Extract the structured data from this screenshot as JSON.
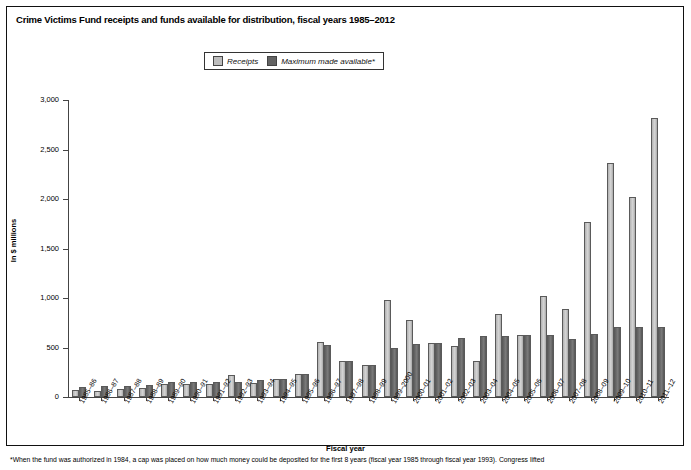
{
  "figure": {
    "title": "Crime Victims Fund receipts and funds available for distribution, fiscal years 1985–2012",
    "ylabel": "In $ millions",
    "xlabel": "Fiscal year",
    "footnote": "*When the fund was authorized in 1984, a cap was placed on how much money could be deposited for the first 8 years (fiscal year 1985 through fiscal year 1993). Congress lifted"
  },
  "legend": {
    "items": [
      {
        "label": "Receipts",
        "color": "#bdbdbd",
        "icon": "square-swatch-icon"
      },
      {
        "label": "Maximum made available*",
        "color": "#636363",
        "icon": "square-swatch-icon"
      }
    ]
  },
  "chart_data": {
    "type": "bar",
    "title": "Crime Victims Fund receipts and funds available for distribution, fiscal years 1985–2012",
    "xlabel": "Fiscal year",
    "ylabel": "In $ millions",
    "ylim": [
      0,
      3000
    ],
    "yticks": [
      0,
      500,
      1000,
      1500,
      2000,
      2500,
      3000
    ],
    "ytick_labels": [
      "0",
      "500",
      "1,000",
      "1,500",
      "2,000",
      "2,500",
      "3,000"
    ],
    "grid": false,
    "legend_position": "top-center",
    "categories": [
      "1985–86",
      "1986–87",
      "1987–88",
      "1988–89",
      "1989–90",
      "1990–91",
      "1991–92",
      "1992–93",
      "1993–94",
      "1994–95",
      "1995–96",
      "1996–97",
      "1997–98",
      "1998–99",
      "1999–2000",
      "2000–01",
      "2001–02",
      "2002–03",
      "2003–04",
      "2004–05",
      "2005–06",
      "2006–07",
      "2007–08",
      "2008–09",
      "2009–10",
      "2010–11",
      "2011–12"
    ],
    "series": [
      {
        "name": "Receipts",
        "color": "#bdbdbd",
        "values": [
          68,
          62,
          77,
          93,
          129,
          128,
          128,
          226,
          144,
          185,
          233,
          553,
          363,
          324,
          985,
          777,
          544,
          519,
          368,
          834,
          625,
          1019,
          894,
          1765,
          2368,
          2021,
          2816
        ]
      },
      {
        "name": "Maximum made available*",
        "color": "#636363",
        "values": [
          100,
          110,
          110,
          125,
          150,
          150,
          150,
          150,
          170,
          185,
          233,
          528,
          363,
          324,
          500,
          537,
          550,
          600,
          620,
          620,
          625,
          625,
          590,
          635,
          705,
          705,
          705
        ]
      }
    ]
  }
}
